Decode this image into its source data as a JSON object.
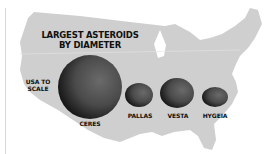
{
  "title_line1": "LARGEST ASTEROIDS",
  "title_line2": "BY DIAMETER",
  "scale_label_line1": "USA TO",
  "scale_label_line2": "SCALE",
  "asteroids": [
    {
      "name": "CERES"
    },
    {
      "name": "PALLAS"
    },
    {
      "name": "VESTA"
    },
    {
      "name": "HYGEIA"
    }
  ],
  "colors": {
    "map": "#cfcfcf",
    "background": "#ffffff",
    "asteroid_dark": "#2a2a2a"
  }
}
